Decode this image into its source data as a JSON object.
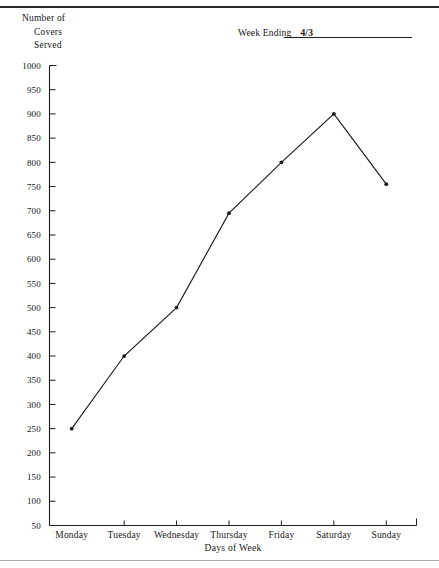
{
  "header": {
    "y_axis_caption_lines": [
      "Number of",
      "Covers",
      "Served"
    ],
    "week_ending_label": "Week Ending",
    "week_ending_value": "4/3"
  },
  "chart_data": {
    "type": "line",
    "title": "",
    "xlabel": "Days of Week",
    "ylabel": "Number of Covers Served",
    "categories": [
      "Monday",
      "Tuesday",
      "Wednesday",
      "Thursday",
      "Friday",
      "Saturday",
      "Sunday"
    ],
    "values": [
      250,
      400,
      500,
      695,
      800,
      900,
      755
    ],
    "series": [
      {
        "name": "Covers Served",
        "values": [
          250,
          400,
          500,
          695,
          800,
          900,
          755
        ]
      }
    ],
    "ylim": [
      50,
      1000
    ],
    "ytick_step": 50,
    "yticks": [
      1000,
      950,
      900,
      850,
      800,
      750,
      700,
      650,
      600,
      550,
      500,
      450,
      400,
      350,
      300,
      250,
      200,
      150,
      100,
      50
    ],
    "ytick_labels": [
      "1000",
      "950",
      "900",
      "850",
      "800",
      "750",
      "700",
      "650",
      "600",
      "550",
      "500",
      "450",
      "400",
      "350",
      "300",
      "250",
      "200",
      "150",
      "100",
      "50"
    ],
    "grid": false,
    "legend": false,
    "legend_position": "none",
    "line_color": "#1d1d1d",
    "marker": "dot"
  }
}
